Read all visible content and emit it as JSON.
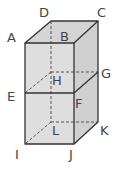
{
  "diagram": {
    "type": "rectangular-prism",
    "fill_color": "#dcdcdc",
    "edge_color": "#333333",
    "vertices": {
      "A": {
        "label": "A",
        "x": 25,
        "y": 43
      },
      "B": {
        "label": "B",
        "x": 74,
        "y": 43
      },
      "C": {
        "label": "C",
        "x": 98,
        "y": 21
      },
      "D": {
        "label": "D",
        "x": 51,
        "y": 21
      },
      "E": {
        "label": "E",
        "x": 25,
        "y": 93
      },
      "F": {
        "label": "F",
        "x": 74,
        "y": 93
      },
      "G": {
        "label": "G",
        "x": 98,
        "y": 72
      },
      "H": {
        "label": "H",
        "x": 51,
        "y": 72
      },
      "I": {
        "label": "I",
        "x": 25,
        "y": 144
      },
      "J": {
        "label": "J",
        "x": 74,
        "y": 144
      },
      "K": {
        "label": "K",
        "x": 98,
        "y": 122
      },
      "L": {
        "label": "L",
        "x": 51,
        "y": 122
      }
    },
    "solid_edges": [
      "AB",
      "BC",
      "CD",
      "DA",
      "AE",
      "EI",
      "IJ",
      "JF",
      "FB",
      "EF",
      "FG",
      "GC",
      "GK",
      "KJ"
    ],
    "dashed_edges": [
      "DH",
      "HL",
      "HE",
      "HG",
      "LI",
      "LK"
    ]
  }
}
